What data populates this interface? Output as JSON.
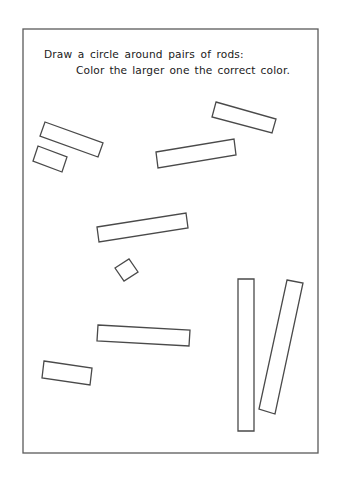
{
  "worksheet": {
    "instructions": {
      "line1": "Draw a circle around pairs of rods:",
      "line2": "Color the larger one the correct color."
    },
    "colors": {
      "background": "#ffffff",
      "stroke": "#4a4a4a",
      "text": "#1a1a1a"
    },
    "border": {
      "x": 23,
      "y": 29,
      "width": 295,
      "height": 424
    },
    "rods": [
      {
        "id": "rod-1",
        "points": "45,122 103,143 98,157 40,136"
      },
      {
        "id": "rod-2",
        "points": "38,146 67,157 62,172 33,161"
      },
      {
        "id": "rod-3",
        "points": "216,102 276,119 272,133 212,117"
      },
      {
        "id": "rod-4",
        "points": "156,152 234,139 236,155 158,168"
      },
      {
        "id": "rod-5",
        "points": "97,227 186,213 188,228 99,242"
      },
      {
        "id": "rod-6",
        "points": "115,268 129,259 138,272 124,281"
      },
      {
        "id": "rod-7",
        "points": "98,325 190,330 189,346 97,341"
      },
      {
        "id": "rod-8",
        "points": "44,361 92,368 90,385 42,378"
      },
      {
        "id": "rod-9",
        "points": "238,279 254,279 254,431 238,431"
      },
      {
        "id": "rod-10",
        "points": "287,280 303,283 275,414 259,409"
      }
    ]
  }
}
